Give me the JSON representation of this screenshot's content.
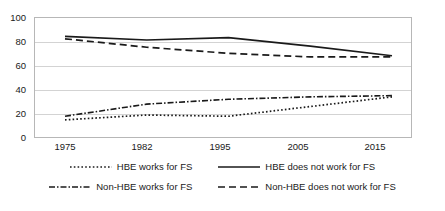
{
  "chart_data": {
    "type": "line",
    "title": "",
    "subtitle": "",
    "xlabel": "",
    "ylabel": "",
    "categories": [
      "1975",
      "1982",
      "1995",
      "2005",
      "2015"
    ],
    "ylim": [
      0,
      100
    ],
    "yticks": [
      0,
      20,
      40,
      60,
      80,
      100
    ],
    "grid": true,
    "legend_position": "bottom",
    "series": [
      {
        "name": "HBE works for FS",
        "style": "dotted",
        "color": "#1a1a1a",
        "values": [
          15,
          19,
          18,
          26,
          34
        ]
      },
      {
        "name": "HBE does not work for FS",
        "style": "solid",
        "color": "#1a1a1a",
        "values": [
          84,
          81,
          83,
          76,
          68
        ]
      },
      {
        "name": "Non-HBE works for FS",
        "style": "dashdot",
        "color": "#1a1a1a",
        "values": [
          18,
          28,
          32,
          34,
          35
        ]
      },
      {
        "name": "Non-HBE does not work for FS",
        "style": "dashed",
        "color": "#1a1a1a",
        "values": [
          82,
          75,
          70,
          67,
          67
        ]
      }
    ]
  },
  "axes": {
    "y_tick_labels": [
      "100",
      "80",
      "60",
      "40",
      "20",
      "0"
    ],
    "x_tick_labels": [
      "1975",
      "1982",
      "1995",
      "2005",
      "2015"
    ]
  },
  "legend": {
    "items": [
      {
        "label": "HBE works for FS",
        "style": "dotted"
      },
      {
        "label": "HBE does not work for FS",
        "style": "solid"
      },
      {
        "label": "Non-HBE works for FS",
        "style": "dashdot"
      },
      {
        "label": "Non-HBE does not work for FS",
        "style": "dashed"
      }
    ]
  },
  "colors": {
    "line": "#1a1a1a",
    "grid": "#d3d3d3",
    "frame": "#b7b7b7",
    "background": "#ffffff"
  }
}
